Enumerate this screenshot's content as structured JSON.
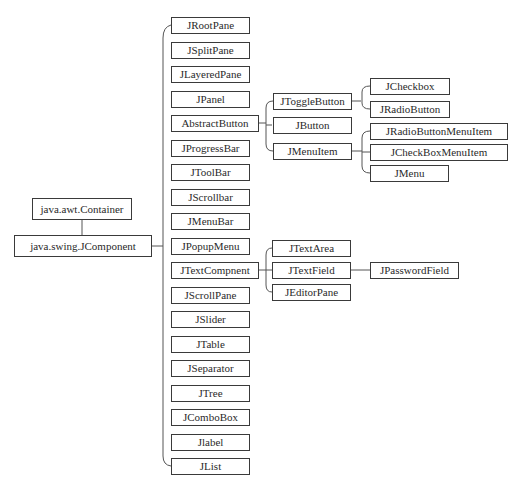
{
  "diagram": {
    "type": "class-hierarchy-tree",
    "root": {
      "label": "java.awt.Container",
      "child": {
        "label": "java.swing.JComponent",
        "children": [
          {
            "label": "JRootPane"
          },
          {
            "label": "JSplitPane"
          },
          {
            "label": "JLayeredPane"
          },
          {
            "label": "JPanel"
          },
          {
            "label": "AbstractButton",
            "children": [
              {
                "label": "JToggleButton",
                "children": [
                  {
                    "label": "JCheckbox"
                  },
                  {
                    "label": "JRadioButton"
                  }
                ]
              },
              {
                "label": "JButton"
              },
              {
                "label": "JMenuItem",
                "children": [
                  {
                    "label": "JRadioButtonMenuItem"
                  },
                  {
                    "label": "JCheckBoxMenuItem"
                  },
                  {
                    "label": "JMenu"
                  }
                ]
              }
            ]
          },
          {
            "label": "JProgressBar"
          },
          {
            "label": "JToolBar"
          },
          {
            "label": "JScrollbar"
          },
          {
            "label": "JMenuBar"
          },
          {
            "label": "JPopupMenu"
          },
          {
            "label": "JTextCompnent",
            "children": [
              {
                "label": "JTextArea"
              },
              {
                "label": "JTextField",
                "children": [
                  {
                    "label": "JPasswordField"
                  }
                ]
              },
              {
                "label": "JEditorPane"
              }
            ]
          },
          {
            "label": "JScrollPane"
          },
          {
            "label": "JSlider"
          },
          {
            "label": "JTable"
          },
          {
            "label": "JSeparator"
          },
          {
            "label": "JTree"
          },
          {
            "label": "JComboBox"
          },
          {
            "label": "Jlabel"
          },
          {
            "label": "JList"
          }
        ]
      }
    }
  },
  "labels": {
    "container": "java.awt.Container",
    "jcomponent": "java.swing.JComponent",
    "level1": [
      "JRootPane",
      "JSplitPane",
      "JLayeredPane",
      "JPanel",
      "AbstractButton",
      "JProgressBar",
      "JToolBar",
      "JScrollbar",
      "JMenuBar",
      "JPopupMenu",
      "JTextCompnent",
      "JScrollPane",
      "JSlider",
      "JTable",
      "JSeparator",
      "JTree",
      "JComboBox",
      "Jlabel",
      "JList"
    ],
    "abstractbutton_children": [
      "JToggleButton",
      "JButton",
      "JMenuItem"
    ],
    "togglebutton_children": [
      "JCheckbox",
      "JRadioButton"
    ],
    "menuitem_children": [
      "JRadioButtonMenuItem",
      "JCheckBoxMenuItem",
      "JMenu"
    ],
    "textcomponent_children": [
      "JTextArea",
      "JTextField",
      "JEditorPane"
    ],
    "textfield_children": [
      "JPasswordField"
    ]
  },
  "colors": {
    "line": "#555555",
    "border": "#3a3a3a",
    "text": "#2a2a2a",
    "background": "#ffffff"
  }
}
